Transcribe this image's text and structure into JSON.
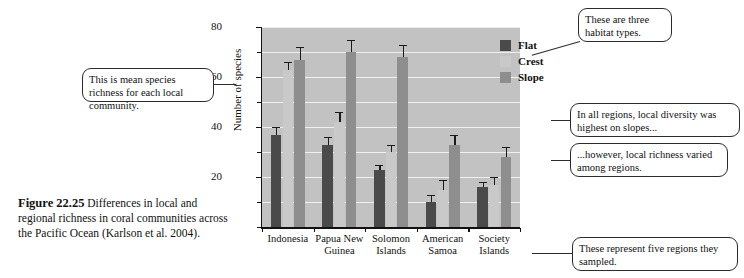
{
  "figure": {
    "number": "Figure 22.25",
    "caption": "Differences in local and regional richness in coral communities across the Pacific Ocean (Karlson et al. 2004)."
  },
  "callouts": [
    {
      "id": "mean",
      "text": "This is mean species richness for each local community."
    },
    {
      "id": "habitat",
      "text": "These are three habitat types."
    },
    {
      "id": "slopes",
      "text": "In all regions, local diversity was highest on slopes..."
    },
    {
      "id": "varied",
      "text": "...however, local richness varied among regions."
    },
    {
      "id": "regions",
      "text": "These represent five regions they sampled."
    }
  ],
  "colors": {
    "flat": "#4a4a4a",
    "crest": "#c9c9c9",
    "slope": "#8e8e8e",
    "plot_background": "#c2c2c2",
    "gridline": "#efefef",
    "axis": "#111111"
  },
  "chart_data": {
    "type": "bar",
    "title": "",
    "xlabel": "",
    "ylabel": "Number of species",
    "ylim": [
      0,
      80
    ],
    "yticks": [
      0,
      10,
      20,
      30,
      40,
      50,
      60,
      70,
      80
    ],
    "ytick_labels": [
      "",
      "",
      "20",
      "",
      "40",
      "",
      "60",
      "",
      "80"
    ],
    "grid": true,
    "legend_position": "top-right",
    "categories": [
      "Indonesia",
      "Papua New Guinea",
      "Solomon Islands",
      "American Samoa",
      "Society Islands"
    ],
    "category_lines": [
      [
        "Indonesia"
      ],
      [
        "Papua New",
        "Guinea"
      ],
      [
        "Solomon",
        "Islands"
      ],
      [
        "American",
        "Samoa"
      ],
      [
        "Society",
        "Islands"
      ]
    ],
    "series": [
      {
        "name": "Flat",
        "color": "#4a4a4a",
        "values": [
          37,
          33,
          23,
          10,
          16
        ],
        "errors": [
          3,
          3,
          2,
          3,
          2
        ]
      },
      {
        "name": "Crest",
        "color": "#c9c9c9",
        "values": [
          63,
          42,
          30,
          15,
          17
        ],
        "errors": [
          3,
          4,
          3,
          4,
          3
        ]
      },
      {
        "name": "Slope",
        "color": "#8e8e8e",
        "values": [
          67,
          70,
          68,
          33,
          28
        ],
        "errors": [
          5,
          5,
          5,
          4,
          4
        ]
      }
    ]
  }
}
